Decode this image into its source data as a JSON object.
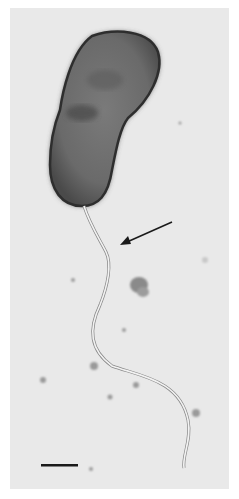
{
  "figure": {
    "type": "transmission-electron-micrograph",
    "background_color": "#e9e9e9",
    "cell_color": "#6a6a6a",
    "cell_edge_color": "#2e2e2e",
    "flagellum_color": "#f2f2f2",
    "annotations": {
      "arrow": {
        "points_to": "flagellum",
        "from": [
          172,
          222
        ],
        "to": [
          120,
          245
        ],
        "color": "#1a1a1a"
      },
      "scale_bar": {
        "x1": 41,
        "x2": 78,
        "y": 465,
        "color": "#1a1a1a",
        "label": ""
      }
    }
  }
}
